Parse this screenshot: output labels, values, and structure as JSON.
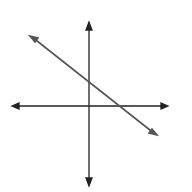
{
  "graph": {
    "equation_label": "3x + 4y = 8",
    "intercept_label": "2",
    "x_axis_label": "x",
    "y_axis_label": "y",
    "grid": {
      "xmin": -5.5,
      "xmax": 5.5,
      "ymin": -5.5,
      "ymax": 6,
      "step": 1
    },
    "line": {
      "slope": -0.75,
      "y_intercept": 2,
      "color": "#555555"
    },
    "colors": {
      "grid": "#bbbbbb",
      "axis": "#222222"
    }
  }
}
